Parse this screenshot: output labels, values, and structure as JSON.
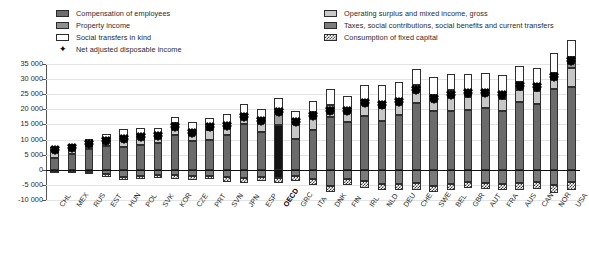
{
  "legend": {
    "column1": [
      {
        "key": "comp",
        "label": "Compensation of employees",
        "swatch": "s-comp",
        "type": "swatch"
      },
      {
        "key": "prop",
        "label": "Property income",
        "swatch": "s-prop",
        "type": "swatch"
      },
      {
        "key": "soc",
        "label": "Social transfers in kind",
        "swatch": "s-soc",
        "type": "swatch"
      },
      {
        "key": "nadi",
        "label": "Net adjusted disposable income",
        "swatch": "marker",
        "type": "marker",
        "glyph": "✦"
      }
    ],
    "column2": [
      {
        "key": "oper",
        "label": "Operating surplus and mixed income, gross",
        "swatch": "s-oper",
        "type": "swatch"
      },
      {
        "key": "tax",
        "label": "Taxes, social contributions, social benefits and current transfers",
        "swatch": "s-tax",
        "type": "swatch"
      },
      {
        "key": "cfc",
        "label": "Consumption of fixed capital",
        "swatch": "s-cfc",
        "type": "swatch"
      }
    ]
  },
  "colors": {
    "compensation": "#6b6b6b",
    "operating_surplus": "#c7c7c7",
    "property_income": "#919191",
    "social_transfers": "#fdfdfd",
    "taxes": "#7a7a7a",
    "consumption_fixed_capital": "#ffffff",
    "highlight": "#141414",
    "marker": "#000000",
    "gridline": "#e3e3e3",
    "axis": "#555555"
  },
  "chart_data": {
    "type": "bar",
    "title": "",
    "xlabel": "",
    "ylabel": "",
    "ylim": [
      -10000,
      35000
    ],
    "ytick_step": 5000,
    "ytick_labels": [
      "35 000",
      "30 000",
      "25 000",
      "20 000",
      "15 000",
      "10 000",
      "5 000",
      "0",
      "-5 000",
      "-10 000"
    ],
    "ytick_values": [
      35000,
      30000,
      25000,
      20000,
      15000,
      10000,
      5000,
      0,
      -5000,
      -10000
    ],
    "grid": true,
    "legend_position": "top",
    "stacked": true,
    "highlight_category": "OECD",
    "categories": [
      "CHL",
      "MEX",
      "RUS",
      "EST",
      "HUN",
      "POL",
      "SVK",
      "KOR",
      "CZE",
      "PRT",
      "SVN",
      "JPN",
      "ESP",
      "OECD",
      "GRC",
      "ITA",
      "DNK",
      "FIN",
      "IRL",
      "NLD",
      "DEU",
      "CHE",
      "SWE",
      "BEL",
      "GBR",
      "AUT",
      "FRA",
      "AUS",
      "CAN",
      "NOR",
      "USA"
    ],
    "series": [
      {
        "name": "Compensation of employees",
        "key": "comp",
        "values": [
          4000,
          5200,
          7000,
          7900,
          7700,
          8200,
          8900,
          11500,
          9500,
          10000,
          11600,
          15200,
          12400,
          14800,
          10200,
          13000,
          17600,
          15700,
          17900,
          16200,
          18000,
          22000,
          19500,
          19300,
          19900,
          20400,
          19600,
          22500,
          21600,
          26800,
          27500
        ]
      },
      {
        "name": "Operating surplus and mixed income, gross",
        "key": "oper",
        "values": [
          2100,
          2100,
          1400,
          1700,
          2400,
          3000,
          1800,
          3300,
          2500,
          3300,
          3000,
          2200,
          3500,
          3600,
          4800,
          4700,
          2300,
          3300,
          3900,
          4300,
          3700,
          4100,
          3500,
          5000,
          4200,
          4200,
          3800,
          4000,
          4500,
          3300,
          6300
        ]
      },
      {
        "name": "Property income",
        "key": "prop",
        "values": [
          400,
          300,
          250,
          400,
          350,
          400,
          400,
          700,
          450,
          700,
          600,
          900,
          700,
          1100,
          700,
          1300,
          1500,
          900,
          1400,
          1900,
          1700,
          2100,
          1700,
          2000,
          1900,
          1700,
          1700,
          2500,
          2200,
          2000,
          3500
        ]
      },
      {
        "name": "Social transfers in kind",
        "key": "soc",
        "values": [
          900,
          900,
          1500,
          1900,
          3100,
          2100,
          2600,
          2000,
          3300,
          3200,
          3300,
          3400,
          3500,
          4200,
          3700,
          3900,
          5200,
          4600,
          4900,
          5600,
          5600,
          5000,
          5900,
          5400,
          5600,
          5700,
          6300,
          5300,
          5400,
          6400,
          5500
        ]
      },
      {
        "name": "Taxes, social contributions, social benefits and current transfers",
        "key": "tax",
        "values": [
          -300,
          -500,
          -900,
          -1400,
          -2400,
          -1900,
          -1600,
          -1800,
          -2200,
          -1900,
          -2400,
          -2600,
          -2300,
          -2800,
          -2100,
          -3200,
          -5400,
          -3000,
          -3700,
          -4600,
          -4600,
          -4300,
          -5300,
          -4700,
          -4200,
          -4400,
          -4600,
          -4300,
          -4100,
          -5200,
          -4200
        ]
      },
      {
        "name": "Consumption of fixed capital",
        "key": "cfc",
        "values": [
          -700,
          -700,
          -600,
          -900,
          -900,
          -1000,
          -1000,
          -1400,
          -1300,
          -1300,
          -1500,
          -1800,
          -1500,
          -1700,
          -1500,
          -1900,
          -1800,
          -1900,
          -2200,
          -2000,
          -2000,
          -2400,
          -2000,
          -2100,
          -1900,
          -2100,
          -2100,
          -2300,
          -2200,
          -2500,
          -2500
        ]
      }
    ],
    "marker_series": {
      "name": "Net adjusted disposable income",
      "key": "nadi",
      "values": [
        6400,
        7300,
        8650,
        9600,
        10250,
        10800,
        11100,
        14300,
        12250,
        14000,
        14600,
        17300,
        16300,
        19200,
        15800,
        17800,
        19400,
        19600,
        22200,
        21400,
        22400,
        26500,
        23300,
        24900,
        25500,
        25500,
        24700,
        27700,
        27400,
        30800,
        36100
      ]
    }
  }
}
